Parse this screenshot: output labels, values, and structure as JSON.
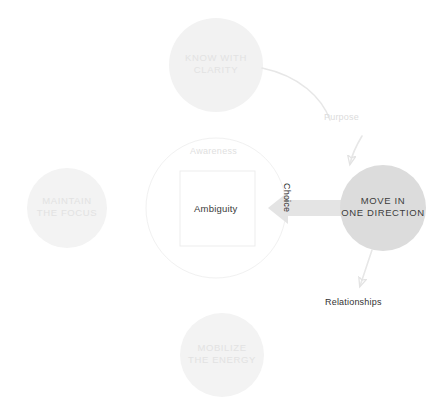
{
  "diagram": {
    "background_color": "#ffffff",
    "nodes": {
      "top": {
        "name": "know-with-clarity",
        "label": "KNOW WITH\nCLARITY",
        "fill_color": "#f2f2f2",
        "text_color": "#e2e2e2",
        "cx": 216,
        "cy": 65,
        "r": 47
      },
      "left": {
        "name": "maintain-the-focus",
        "label": "MAINTAIN\nTHE FOCUS",
        "fill_color": "#f3f3f3",
        "text_color": "#e2e2e2",
        "cx": 67,
        "cy": 208,
        "r": 40
      },
      "bottom": {
        "name": "mobilize-the-energy",
        "label": "MOBILIZE\nTHE ENERGY",
        "fill_color": "#f3f3f3",
        "text_color": "#e2e2e2",
        "cx": 222,
        "cy": 355,
        "r": 42
      },
      "right": {
        "name": "move-in-one-direction",
        "label": "MOVE IN\nONE DIRECTION",
        "fill_color": "#dcdcdc",
        "text_color": "#3c3c3c",
        "cx": 383,
        "cy": 208,
        "r": 43
      }
    },
    "center": {
      "awareness_label": "Awareness",
      "awareness_color": "#e0e0e0",
      "circle_stroke": "#f0f0f0",
      "circle_cx": 216,
      "circle_cy": 208,
      "circle_r": 70,
      "box_label": "Ambiguity",
      "box_text_color": "#3a3a3a",
      "box_border_color": "#ececec",
      "box_fill": "#ffffff"
    },
    "edges": [
      {
        "name": "choice-arrow",
        "label": "Choice",
        "label_color": "#2e2e2e",
        "from": "move-in-one-direction",
        "to": "ambiguity-box",
        "arrow_color": "#e0e0e0",
        "style": "block-arrow-left"
      },
      {
        "name": "purpose-edge",
        "label": "Purpose",
        "label_color": "#dcdcdc",
        "from": "know-with-clarity",
        "to": "move-in-one-direction",
        "arrow_color": "#e6e6e6",
        "style": "curved-arrow"
      },
      {
        "name": "relationships-edge",
        "label": "Relationships",
        "label_color": "#333333",
        "from": "move-in-one-direction",
        "to": "relationships-label",
        "arrow_color": "#e6e6e6",
        "style": "curved-arrow"
      }
    ]
  }
}
